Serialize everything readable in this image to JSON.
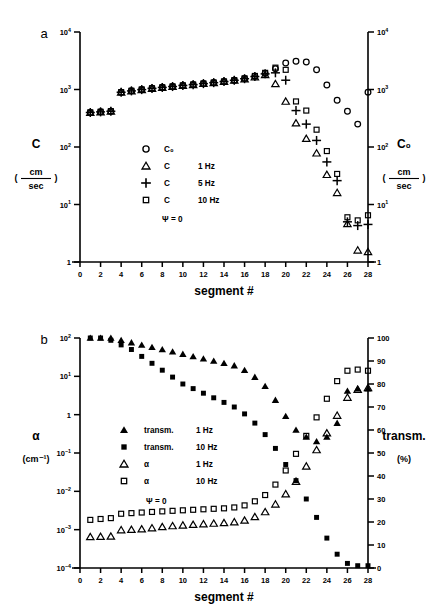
{
  "figure": {
    "panel_a_label": "a",
    "panel_b_label": "b"
  },
  "panel_a": {
    "left_axis": {
      "title": "C",
      "unit_num": "cm",
      "unit_den": "sec",
      "ticks": [
        "10⁴",
        "10³",
        "10²",
        "10",
        "1"
      ]
    },
    "right_axis": {
      "title": "C₀",
      "unit_num": "cm",
      "unit_den": "sec",
      "ticks": [
        "10⁴",
        "10³",
        "10²",
        "10",
        "1"
      ]
    },
    "x_axis": {
      "title": "segment  #",
      "ticks": [
        "0",
        "2",
        "4",
        "6",
        "8",
        "10",
        "12",
        "14",
        "16",
        "18",
        "20",
        "22",
        "24",
        "26",
        "28"
      ]
    },
    "legend": {
      "items": [
        {
          "marker": "circle-open",
          "label": "C₀",
          "freq": ""
        },
        {
          "marker": "triangle-open",
          "label": "C",
          "freq": "1 Hz"
        },
        {
          "marker": "plus",
          "label": "C",
          "freq": "5 Hz"
        },
        {
          "marker": "square-open",
          "label": "C",
          "freq": "10 Hz"
        }
      ],
      "note": "Ψ = 0"
    }
  },
  "panel_b": {
    "left_axis": {
      "title": "α",
      "unit": "(cm⁻¹)",
      "ticks": [
        "10²",
        "10",
        "1",
        "10⁻¹",
        "10⁻²",
        "10⁻³",
        "10⁻⁴"
      ]
    },
    "right_axis": {
      "title": "transm.",
      "unit": "(%)",
      "ticks": [
        "100",
        "90",
        "80",
        "70",
        "60",
        "50",
        "40",
        "30",
        "20",
        "10",
        "0"
      ]
    },
    "x_axis": {
      "title": "segment  #",
      "ticks": [
        "0",
        "2",
        "4",
        "6",
        "8",
        "10",
        "12",
        "14",
        "16",
        "18",
        "20",
        "22",
        "24",
        "26",
        "28"
      ]
    },
    "legend": {
      "items": [
        {
          "marker": "triangle-filled",
          "label": "transm.",
          "freq": "1 Hz"
        },
        {
          "marker": "square-filled",
          "label": "transm.",
          "freq": "10 Hz"
        },
        {
          "marker": "triangle-open",
          "label": "α",
          "freq": "1 Hz"
        },
        {
          "marker": "square-open",
          "label": "α",
          "freq": "10 Hz"
        }
      ],
      "note": "Ψ = 0"
    }
  },
  "chart_data": [
    {
      "type": "scatter",
      "title": "a",
      "xlabel": "segment  #",
      "ylabel": "C (cm/sec)",
      "y2label": "C₀ (cm/sec)",
      "xlim": [
        0,
        28
      ],
      "ylim": [
        1,
        10000
      ],
      "yscale": "log",
      "grid": false,
      "legend_position": "center-left",
      "annotations": [
        "Ψ = 0"
      ],
      "x": [
        1,
        2,
        3,
        4,
        5,
        6,
        7,
        8,
        9,
        10,
        11,
        12,
        13,
        14,
        15,
        16,
        17,
        18,
        19,
        20,
        21,
        22,
        23,
        24,
        25,
        26,
        27,
        28
      ],
      "series": [
        {
          "name": "C₀",
          "marker": "circle-open",
          "values": [
            400,
            410,
            420,
            900,
            950,
            1000,
            1050,
            1090,
            1130,
            1180,
            1220,
            1270,
            1320,
            1380,
            1450,
            1550,
            1700,
            1900,
            2300,
            2900,
            3100,
            3000,
            2200,
            1200,
            650,
            420,
            250,
            900
          ]
        },
        {
          "name": "C 1 Hz",
          "marker": "triangle-open",
          "values": [
            395,
            405,
            415,
            890,
            940,
            990,
            1040,
            1080,
            1120,
            1170,
            1210,
            1260,
            1310,
            1370,
            1440,
            1520,
            1650,
            1800,
            1250,
            620,
            260,
            140,
            78,
            33,
            16,
            4.6,
            1.6,
            1.5
          ]
        },
        {
          "name": "C 5 Hz",
          "marker": "plus",
          "values": [
            398,
            408,
            418,
            895,
            945,
            995,
            1045,
            1085,
            1125,
            1175,
            1215,
            1265,
            1315,
            1375,
            1445,
            1540,
            1680,
            1870,
            1950,
            1450,
            430,
            250,
            130,
            55,
            26,
            5.0,
            4.3,
            4.5
          ]
        },
        {
          "name": "C 10 Hz",
          "marker": "square-open",
          "values": [
            400,
            410,
            420,
            900,
            950,
            1000,
            1050,
            1090,
            1130,
            1180,
            1220,
            1270,
            1320,
            1380,
            1450,
            1560,
            1720,
            1950,
            2400,
            2200,
            620,
            430,
            200,
            85,
            34,
            6.0,
            5.3,
            6.5
          ]
        }
      ]
    },
    {
      "type": "scatter",
      "title": "b",
      "xlabel": "segment  #",
      "ylabel": "α (cm⁻¹)",
      "y2label": "transm. (%)",
      "xlim": [
        0,
        28
      ],
      "ylim": [
        0.0001,
        100
      ],
      "yscale": "log",
      "y2lim": [
        0,
        100
      ],
      "y2scale": "linear",
      "grid": false,
      "legend_position": "center-left",
      "annotations": [
        "Ψ = 0"
      ],
      "x": [
        1,
        2,
        3,
        4,
        5,
        6,
        7,
        8,
        9,
        10,
        11,
        12,
        13,
        14,
        15,
        16,
        17,
        18,
        19,
        20,
        21,
        22,
        23,
        24,
        25,
        26,
        27,
        28
      ],
      "series": [
        {
          "name": "transm. 1 Hz",
          "marker": "triangle-filled",
          "axis": "right",
          "values": [
            100,
            100,
            100,
            99,
            98,
            97,
            96,
            95,
            94,
            93,
            92,
            91,
            90,
            89,
            88,
            86,
            83,
            79,
            73,
            66,
            60,
            57,
            55,
            57,
            63,
            77,
            78,
            78
          ]
        },
        {
          "name": "transm. 10 Hz",
          "marker": "square-filled",
          "axis": "right",
          "values": [
            100,
            100,
            99,
            97,
            95,
            92,
            89,
            86,
            83,
            80,
            78,
            76,
            74,
            72,
            70,
            67,
            63,
            58,
            52,
            45,
            38,
            30,
            22,
            13,
            6,
            2,
            1,
            1
          ]
        },
        {
          "name": "α 1 Hz",
          "marker": "triangle-open",
          "axis": "left",
          "values": [
            0.00065,
            0.00066,
            0.00067,
            0.00098,
            0.001,
            0.00103,
            0.0011,
            0.00118,
            0.00125,
            0.0013,
            0.00135,
            0.0014,
            0.00145,
            0.0015,
            0.00158,
            0.00175,
            0.00215,
            0.0029,
            0.0046,
            0.0085,
            0.018,
            0.045,
            0.12,
            0.33,
            0.95,
            2.8,
            4.5,
            5.0
          ]
        },
        {
          "name": "α 10 Hz",
          "marker": "square-open",
          "axis": "left",
          "values": [
            0.0018,
            0.0019,
            0.002,
            0.0026,
            0.0027,
            0.0028,
            0.0029,
            0.003,
            0.0031,
            0.0032,
            0.0033,
            0.0034,
            0.0035,
            0.0036,
            0.0038,
            0.0043,
            0.0055,
            0.008,
            0.015,
            0.035,
            0.095,
            0.28,
            0.85,
            2.6,
            7.5,
            14,
            15,
            14
          ]
        }
      ]
    }
  ]
}
